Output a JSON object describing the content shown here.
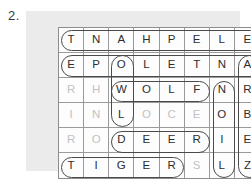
{
  "exercise": {
    "number": "2."
  },
  "puzzle": {
    "type": "word-search",
    "columns": 8,
    "rows": 6,
    "colors": {
      "panel_background": "#ebebeb",
      "grid_background": "#fdfdfd",
      "grid_line": "#9a9a9a",
      "letter_dark": "#2d2d2d",
      "letter_faded": "#c2c2c2",
      "circle_stroke": "#4a4a4a"
    },
    "grid": [
      [
        {
          "letter": "T",
          "faded": false
        },
        {
          "letter": "N",
          "faded": false
        },
        {
          "letter": "A",
          "faded": false
        },
        {
          "letter": "H",
          "faded": false
        },
        {
          "letter": "P",
          "faded": false
        },
        {
          "letter": "E",
          "faded": false
        },
        {
          "letter": "L",
          "faded": false
        },
        {
          "letter": "E",
          "faded": false
        }
      ],
      [
        {
          "letter": "E",
          "faded": false
        },
        {
          "letter": "P",
          "faded": false
        },
        {
          "letter": "O",
          "faded": false
        },
        {
          "letter": "L",
          "faded": false
        },
        {
          "letter": "E",
          "faded": false
        },
        {
          "letter": "T",
          "faded": false
        },
        {
          "letter": "N",
          "faded": false
        },
        {
          "letter": "A",
          "faded": false
        }
      ],
      [
        {
          "letter": "R",
          "faded": true
        },
        {
          "letter": "H",
          "faded": true
        },
        {
          "letter": "W",
          "faded": false
        },
        {
          "letter": "O",
          "faded": false
        },
        {
          "letter": "L",
          "faded": false
        },
        {
          "letter": "F",
          "faded": false
        },
        {
          "letter": "N",
          "faded": false
        },
        {
          "letter": "R",
          "faded": false
        }
      ],
      [
        {
          "letter": "I",
          "faded": true
        },
        {
          "letter": "N",
          "faded": true
        },
        {
          "letter": "L",
          "faded": false
        },
        {
          "letter": "O",
          "faded": true
        },
        {
          "letter": "C",
          "faded": true
        },
        {
          "letter": "E",
          "faded": true
        },
        {
          "letter": "O",
          "faded": false
        },
        {
          "letter": "B",
          "faded": false
        }
      ],
      [
        {
          "letter": "R",
          "faded": true
        },
        {
          "letter": "O",
          "faded": true
        },
        {
          "letter": "D",
          "faded": false
        },
        {
          "letter": "E",
          "faded": false
        },
        {
          "letter": "E",
          "faded": false
        },
        {
          "letter": "R",
          "faded": false
        },
        {
          "letter": "I",
          "faded": false
        },
        {
          "letter": "E",
          "faded": false
        }
      ],
      [
        {
          "letter": "T",
          "faded": false
        },
        {
          "letter": "I",
          "faded": false
        },
        {
          "letter": "G",
          "faded": false
        },
        {
          "letter": "E",
          "faded": false
        },
        {
          "letter": "R",
          "faded": false
        },
        {
          "letter": "S",
          "faded": true
        },
        {
          "letter": "L",
          "faded": false
        },
        {
          "letter": "Z",
          "faded": false
        }
      ]
    ],
    "marked_words": [
      {
        "name": "row1-circle",
        "orientation": "horizontal",
        "row": 1,
        "col_start": 1,
        "col_end": 8,
        "text": "TNAHPELE"
      },
      {
        "name": "row2-circle",
        "orientation": "horizontal",
        "row": 2,
        "col_start": 1,
        "col_end": 8,
        "text": "EPOLETNA"
      },
      {
        "name": "owl-circle",
        "orientation": "vertical",
        "col": 3,
        "row_start": 2,
        "row_end": 4,
        "text": "OWL"
      },
      {
        "name": "wolf-circle",
        "orientation": "horizontal",
        "row": 3,
        "col_start": 3,
        "col_end": 6,
        "text": "WOLF"
      },
      {
        "name": "deer-circle",
        "orientation": "horizontal",
        "row": 5,
        "col_start": 3,
        "col_end": 6,
        "text": "DEER"
      },
      {
        "name": "tiger-circle",
        "orientation": "horizontal",
        "row": 6,
        "col_start": 1,
        "col_end": 5,
        "text": "TIGER"
      },
      {
        "name": "noil-circle",
        "orientation": "vertical",
        "col": 7,
        "row_start": 3,
        "row_end": 6,
        "text": "NOIL"
      },
      {
        "name": "arbez-circle",
        "orientation": "vertical",
        "col": 8,
        "row_start": 2,
        "row_end": 6,
        "text": "ARBEZ"
      }
    ]
  }
}
